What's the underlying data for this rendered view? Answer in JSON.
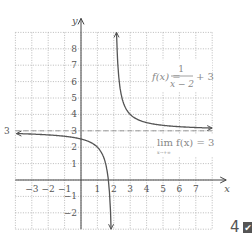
{
  "chart_data": {
    "type": "line",
    "title": "",
    "xlabel": "x",
    "ylabel": "y",
    "xlim": [
      -4,
      8
    ],
    "ylim": [
      -3,
      9
    ],
    "grid": true,
    "x_ticks": [
      "-3",
      "-2",
      "-1",
      "1",
      "2",
      "3",
      "4",
      "5",
      "6",
      "7"
    ],
    "y_ticks": [
      "8",
      "7",
      "6",
      "5",
      "4",
      "3",
      "2",
      "1",
      "-1",
      "-2"
    ],
    "series": [
      {
        "name": "f(x) = 1/(x-2) + 3",
        "function": "1/(x-2)+3",
        "color": "#555555"
      }
    ],
    "asymptotes": {
      "horizontal_y": 3,
      "vertical_x": 2
    },
    "annotations": [
      {
        "text": "f(x) = 1/(x − 2) + 3",
        "position": "upper right"
      },
      {
        "text": "lim f(x) = 3",
        "subscript": "x→+∞",
        "position": "right, below asymptote"
      },
      {
        "text": "3",
        "position": "left of grid at y=3"
      }
    ]
  },
  "labels": {
    "y_axis": "y",
    "x_axis": "x",
    "left_three": "3",
    "func_lhs": "f(x) =",
    "func_num": "1",
    "func_den": "x − 2",
    "func_tail": "+ 3",
    "lim_text": "lim  f(x) = 3",
    "lim_sub": "x→+∞"
  },
  "badge": {
    "number": "4",
    "check": "✔"
  }
}
